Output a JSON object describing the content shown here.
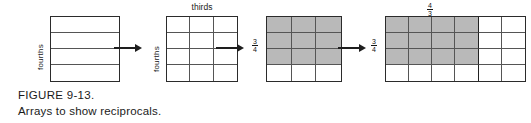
{
  "figure": {
    "caption_title": "FIGURE 9-13.",
    "caption_text": "Arrays to show reciprocals."
  },
  "arrays": [
    {
      "id": "array-fourths",
      "side_label": "fourths",
      "top_label": "",
      "rows": 4,
      "cols": 1,
      "shaded_rows": 0,
      "shaded_cols": 0,
      "heavy_col_divider": 0
    },
    {
      "id": "array-fourths-by-thirds",
      "side_label": "fourths",
      "top_label": "thirds",
      "rows": 4,
      "cols": 3,
      "shaded_rows": 0,
      "shaded_cols": 0,
      "heavy_col_divider": 0
    },
    {
      "id": "array-three-fourths",
      "side_label_fraction": {
        "numerator": "3",
        "denominator": "4"
      },
      "top_label": "",
      "rows": 4,
      "cols": 3,
      "shaded_rows": 3,
      "shaded_cols": 3,
      "heavy_col_divider": 0
    },
    {
      "id": "array-four-thirds",
      "side_label_fraction": {
        "numerator": "3",
        "denominator": "4"
      },
      "top_label_fraction": {
        "numerator": "4",
        "denominator": "3"
      },
      "rows": 4,
      "cols": 6,
      "shaded_rows": 3,
      "shaded_cols": 4,
      "heavy_col_divider": 3
    }
  ],
  "arrows": [
    {
      "id": "arrow-1"
    },
    {
      "id": "arrow-2"
    },
    {
      "id": "arrow-3"
    }
  ],
  "colors": {
    "shade": "#b9b9b9",
    "stroke": "#2b2b2b",
    "ink": "#1a1a1a"
  }
}
